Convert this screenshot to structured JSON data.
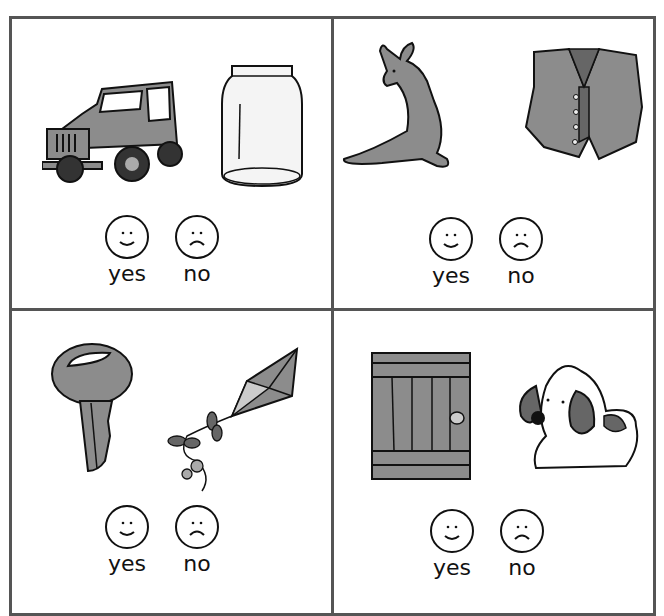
{
  "worksheet": {
    "cells": [
      {
        "items": [
          "jeep",
          "jar"
        ],
        "yes_label": "yes",
        "no_label": "no"
      },
      {
        "items": [
          "kangaroo",
          "vest"
        ],
        "yes_label": "yes",
        "no_label": "no"
      },
      {
        "items": [
          "key",
          "kite"
        ],
        "yes_label": "yes",
        "no_label": "no"
      },
      {
        "items": [
          "door",
          "dog"
        ],
        "yes_label": "yes",
        "no_label": "no"
      }
    ]
  },
  "colors": {
    "border": "#555555",
    "fill_gray": "#8c8c8c",
    "fill_dark": "#666666",
    "line": "#111111"
  }
}
